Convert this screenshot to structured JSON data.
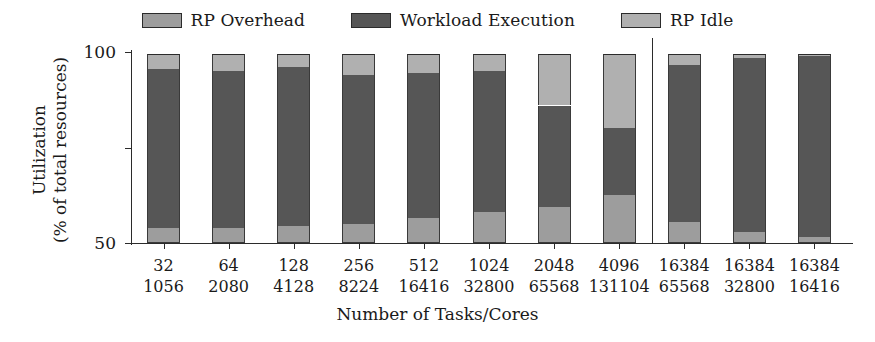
{
  "chart_data": {
    "type": "bar",
    "subtype": "stacked-bar",
    "title": "",
    "xlabel": "Number of Tasks/Cores",
    "ylabel": "Utilization\n(% of total resources)",
    "ylabel_line1": "Utilization",
    "ylabel_line2": "(% of total resources)",
    "ylim": [
      0,
      105
    ],
    "yticks": [
      0,
      50,
      100
    ],
    "ytick_labels": [
      "0",
      "50",
      "100"
    ],
    "grid": false,
    "legend_position": "top-center",
    "stack_order_bottom_to_top": [
      "RP Overhead",
      "Workload Execution",
      "RP Idle"
    ],
    "categories": [
      "32/1056",
      "64/2080",
      "128/4128",
      "256/8224",
      "512/16416",
      "1024/32800",
      "2048/65568",
      "4096/131104",
      "16384/65568",
      "16384/32800",
      "16384/16416"
    ],
    "category_tasks": [
      "32",
      "64",
      "128",
      "256",
      "512",
      "1024",
      "2048",
      "4096",
      "16384",
      "16384",
      "16384"
    ],
    "category_cores": [
      "1056",
      "2080",
      "4128",
      "8224",
      "16416",
      "32800",
      "65568",
      "131104",
      "65568",
      "32800",
      "16416"
    ],
    "series": [
      {
        "name": "RP Overhead",
        "color": "#9d9d9d",
        "values": [
          8,
          8,
          9,
          10,
          13,
          16,
          19,
          25,
          11,
          6,
          3
        ]
      },
      {
        "name": "Workload Execution",
        "color": "#565656",
        "values": [
          83,
          82,
          83,
          78,
          76,
          74,
          53,
          35,
          82,
          91,
          95
        ]
      },
      {
        "name": "RP Idle",
        "color": "#b0b0b0",
        "values": [
          8,
          9,
          7,
          11,
          10,
          9,
          27,
          39,
          6,
          2,
          1
        ]
      }
    ],
    "bar_totals": [
      99,
      99,
      99,
      99,
      99,
      99,
      99,
      99,
      99,
      99,
      99
    ],
    "group_separator_after_category_index": 7,
    "annotations": []
  },
  "legend": {
    "entries": [
      {
        "label": "RP Overhead",
        "color": "#9d9d9d"
      },
      {
        "label": "Workload Execution",
        "color": "#565656"
      },
      {
        "label": "RP Idle",
        "color": "#b0b0b0"
      }
    ]
  },
  "axes": {
    "y_title_line1": "Utilization",
    "y_title_line2": "(% of total resources)",
    "x_title": "Number of Tasks/Cores",
    "y_tick_labels": [
      "100",
      "50",
      "0"
    ]
  },
  "colors": {
    "overhead": "#9d9d9d",
    "workload": "#565656",
    "idle": "#b0b0b0",
    "axis": "#2b2b2b",
    "background": "#ffffff"
  }
}
